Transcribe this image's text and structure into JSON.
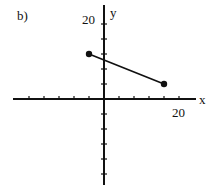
{
  "panel_label": "b)",
  "chart_data": {
    "type": "line",
    "title": "",
    "xlabel": "x",
    "ylabel": "y",
    "x_tick_label": "20",
    "y_tick_label": "20",
    "tick_step": 4,
    "xlim": [
      -20,
      20
    ],
    "ylim": [
      -20,
      20
    ],
    "grid": false,
    "series": [
      {
        "name": "segment",
        "points": [
          {
            "x": -4,
            "y": 12
          },
          {
            "x": 16,
            "y": 4
          }
        ],
        "endpoints": "closed-dots"
      }
    ],
    "colors": {
      "axis": "#111111",
      "line": "#111111"
    }
  }
}
